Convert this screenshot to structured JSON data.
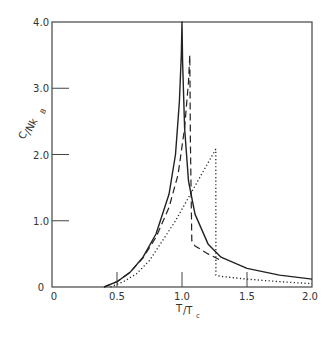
{
  "chart_data": {
    "type": "line",
    "title": "",
    "xlabel": "T/T_c",
    "ylabel": "C/Nk_B",
    "xlim": [
      0,
      2.0
    ],
    "ylim": [
      0,
      4.0
    ],
    "grid": false,
    "legend": null,
    "x_ticks": [
      "0",
      "0.5",
      "1.0",
      "1.5",
      "2.0"
    ],
    "y_ticks": [
      "0",
      "1.0",
      "2.0",
      "3.0",
      "4.0"
    ],
    "series": [
      {
        "name": "solid",
        "style": "solid",
        "x": [
          0.4,
          0.5,
          0.6,
          0.7,
          0.8,
          0.9,
          0.95,
          0.98,
          0.995,
          1.0,
          1.005,
          1.02,
          1.05,
          1.1,
          1.2,
          1.3,
          1.5,
          1.75,
          2.0
        ],
        "y": [
          0.0,
          0.08,
          0.22,
          0.45,
          0.8,
          1.4,
          2.0,
          2.8,
          3.5,
          4.0,
          3.4,
          2.4,
          1.6,
          1.1,
          0.65,
          0.45,
          0.28,
          0.18,
          0.12
        ]
      },
      {
        "name": "dashed",
        "style": "dashed",
        "x": [
          0.4,
          0.5,
          0.6,
          0.7,
          0.8,
          0.9,
          0.97,
          1.02,
          1.05,
          1.06,
          1.065,
          1.075,
          1.1,
          1.2,
          1.3
        ],
        "y": [
          0.0,
          0.08,
          0.22,
          0.44,
          0.75,
          1.2,
          1.7,
          2.4,
          3.1,
          3.5,
          2.2,
          0.7,
          0.62,
          0.5,
          0.4
        ]
      },
      {
        "name": "dotted",
        "style": "dotted",
        "x": [
          0.45,
          0.55,
          0.65,
          0.75,
          0.85,
          0.95,
          1.05,
          1.15,
          1.26,
          1.261,
          1.3,
          1.5,
          1.75,
          2.0
        ],
        "y": [
          0.0,
          0.08,
          0.2,
          0.4,
          0.7,
          1.0,
          1.35,
          1.7,
          2.08,
          0.18,
          0.16,
          0.12,
          0.08,
          0.05
        ]
      }
    ]
  },
  "axes": {
    "x_label_main": "T",
    "x_label_sub": "c",
    "x_label_sep": "/T",
    "y_label_main": "C",
    "y_label_sep": "/Nk",
    "y_label_sub": "B"
  }
}
